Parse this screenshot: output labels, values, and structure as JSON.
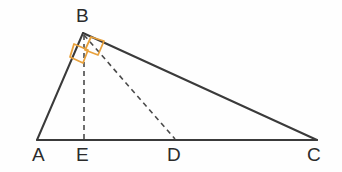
{
  "figure": {
    "kind": "geometry-diagram",
    "canvas": {
      "width": 342,
      "height": 172,
      "background": "#fefefe"
    },
    "style": {
      "solid_stroke": "#3a3a3a",
      "solid_width": 2,
      "dashed_stroke": "#4a4a4a",
      "dashed_width": 1.6,
      "dash_pattern": "5,4",
      "angle_mark_color": "#e8a13c",
      "angle_mark_width": 1.8,
      "label_color": "#2b2b2b",
      "label_size": 19
    },
    "points": [
      {
        "id": "A",
        "label": "A",
        "x": 37,
        "y": 140,
        "label_x": 32,
        "label_y": 161
      },
      {
        "id": "B",
        "label": "B",
        "x": 83,
        "y": 33,
        "label_x": 76,
        "label_y": 22
      },
      {
        "id": "E",
        "label": "E",
        "x": 84,
        "y": 140,
        "label_x": 76,
        "label_y": 161
      },
      {
        "id": "D",
        "label": "D",
        "x": 175,
        "y": 140,
        "label_x": 167,
        "label_y": 161
      },
      {
        "id": "C",
        "label": "C",
        "x": 317,
        "y": 140,
        "label_x": 307,
        "label_y": 161
      }
    ],
    "solid_segments": [
      {
        "name": "side-AB",
        "from": "A",
        "to": "B"
      },
      {
        "name": "side-BC",
        "from": "B",
        "to": "C"
      },
      {
        "name": "base-AC",
        "from": "A",
        "to": "C"
      }
    ],
    "dashed_segments": [
      {
        "name": "altitude-BE",
        "from": "B",
        "to": "E"
      },
      {
        "name": "cevian-BD",
        "from": "B",
        "to": "D"
      }
    ],
    "angle_marks": [
      {
        "name": "right-angle-mark-ABE",
        "at": "B",
        "between": [
          "A",
          "E"
        ],
        "points": "74,44 88,50 83,63 70,57"
      },
      {
        "name": "right-angle-mark-EBD",
        "at": "B",
        "between": [
          "C",
          "D"
        ],
        "points": "104,41 98,55 85,50 91,37"
      }
    ]
  }
}
